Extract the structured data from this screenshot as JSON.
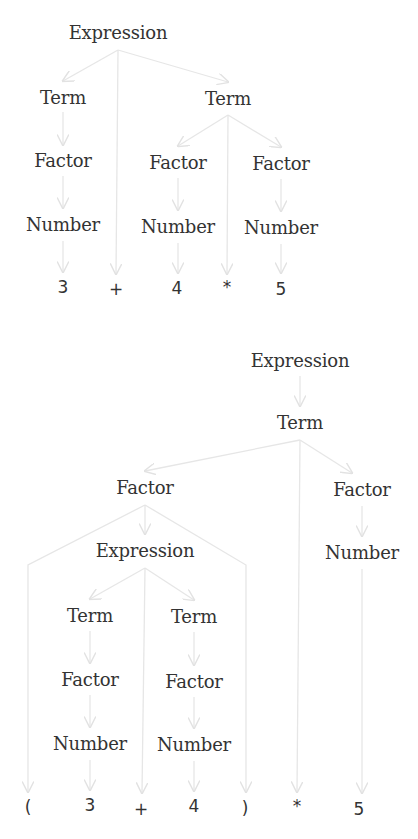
{
  "edge_color": "#e4e4e4",
  "text_color": "#333333",
  "trees": [
    {
      "name": "parse-tree-3-plus-4-times-5",
      "nodes": [
        {
          "id": "e",
          "label": "Expression",
          "x": 118,
          "y": 32
        },
        {
          "id": "t1",
          "label": "Term",
          "x": 63,
          "y": 97
        },
        {
          "id": "t2",
          "label": "Term",
          "x": 228,
          "y": 98
        },
        {
          "id": "f1",
          "label": "Factor",
          "x": 63,
          "y": 160
        },
        {
          "id": "f2",
          "label": "Factor",
          "x": 178,
          "y": 162
        },
        {
          "id": "f3",
          "label": "Factor",
          "x": 281,
          "y": 163
        },
        {
          "id": "n1",
          "label": "Number",
          "x": 63,
          "y": 224
        },
        {
          "id": "n2",
          "label": "Number",
          "x": 178,
          "y": 226
        },
        {
          "id": "n3",
          "label": "Number",
          "x": 281,
          "y": 227
        }
      ],
      "tokens": [
        {
          "id": "k1",
          "label": "3",
          "x": 63,
          "y": 287
        },
        {
          "id": "k2",
          "label": "+",
          "x": 116,
          "y": 289
        },
        {
          "id": "k3",
          "label": "4",
          "x": 177,
          "y": 288
        },
        {
          "id": "k4",
          "label": "*",
          "x": 227,
          "y": 287
        },
        {
          "id": "k5",
          "label": "5",
          "x": 281,
          "y": 289
        }
      ]
    },
    {
      "name": "parse-tree-paren-3-plus-4-times-5",
      "nodes": [
        {
          "id": "E",
          "label": "Expression",
          "x": 300,
          "y": 360
        },
        {
          "id": "T",
          "label": "Term",
          "x": 300,
          "y": 422
        },
        {
          "id": "F1",
          "label": "Factor",
          "x": 145,
          "y": 487
        },
        {
          "id": "F2",
          "label": "Factor",
          "x": 362,
          "y": 489
        },
        {
          "id": "E2",
          "label": "Expression",
          "x": 145,
          "y": 550
        },
        {
          "id": "N3",
          "label": "Number",
          "x": 362,
          "y": 552
        },
        {
          "id": "T1",
          "label": "Term",
          "x": 90,
          "y": 615
        },
        {
          "id": "T2",
          "label": "Term",
          "x": 194,
          "y": 616
        },
        {
          "id": "F3",
          "label": "Factor",
          "x": 90,
          "y": 679
        },
        {
          "id": "F4",
          "label": "Factor",
          "x": 194,
          "y": 681
        },
        {
          "id": "N1",
          "label": "Number",
          "x": 90,
          "y": 743
        },
        {
          "id": "N2",
          "label": "Number",
          "x": 194,
          "y": 744
        }
      ],
      "tokens": [
        {
          "id": "K1",
          "label": "(",
          "x": 28,
          "y": 807
        },
        {
          "id": "K2",
          "label": "3",
          "x": 90,
          "y": 805
        },
        {
          "id": "K3",
          "label": "+",
          "x": 141,
          "y": 809
        },
        {
          "id": "K4",
          "label": "4",
          "x": 194,
          "y": 806
        },
        {
          "id": "K5",
          "label": ")",
          "x": 245,
          "y": 808
        },
        {
          "id": "K6",
          "label": "*",
          "x": 297,
          "y": 806
        },
        {
          "id": "K7",
          "label": "5",
          "x": 359,
          "y": 809
        }
      ]
    }
  ]
}
